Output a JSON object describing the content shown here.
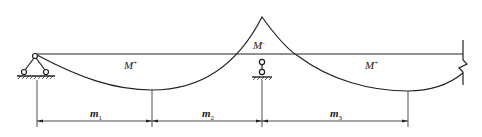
{
  "diagram": {
    "type": "bending-moment-diagram",
    "moment_labels": {
      "left_span": {
        "base": "M",
        "sign": "+"
      },
      "middle_support": {
        "base": "M",
        "sign": "-"
      },
      "right_span": {
        "base": "M",
        "sign": "+"
      }
    },
    "dimension_labels": [
      {
        "base": "m",
        "sub": "1"
      },
      {
        "base": "m",
        "sub": "2"
      },
      {
        "base": "m",
        "sub": "3"
      }
    ],
    "supports": [
      "pin-support",
      "roller-support",
      "fixed-break-end"
    ],
    "colors": {
      "line": "#222222",
      "background": "#ffffff"
    }
  }
}
